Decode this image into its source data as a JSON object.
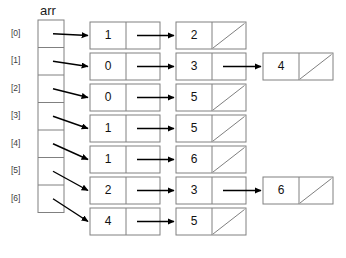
{
  "diagram": {
    "title": "arr",
    "array": {
      "label": "arr",
      "x": 38,
      "y": 20,
      "width": 26,
      "cell_height": 27.5,
      "count": 7,
      "index_labels": [
        "[0]",
        "[1]",
        "[2]",
        "[3]",
        "[4]",
        "[5]",
        "[6]"
      ]
    },
    "node": {
      "width": 70,
      "height": 27,
      "data_width": 36,
      "col_x": [
        90,
        176,
        263
      ]
    },
    "rows": [
      {
        "y": 22,
        "nodes": [
          {
            "value": "1",
            "next": true
          },
          {
            "value": "2",
            "next": false
          }
        ]
      },
      {
        "y": 53,
        "nodes": [
          {
            "value": "0",
            "next": true
          },
          {
            "value": "3",
            "next": true
          },
          {
            "value": "4",
            "next": false
          }
        ]
      },
      {
        "y": 84,
        "nodes": [
          {
            "value": "0",
            "next": true
          },
          {
            "value": "5",
            "next": false
          }
        ]
      },
      {
        "y": 115,
        "nodes": [
          {
            "value": "1",
            "next": true
          },
          {
            "value": "5",
            "next": false
          }
        ]
      },
      {
        "y": 146,
        "nodes": [
          {
            "value": "1",
            "next": true
          },
          {
            "value": "6",
            "next": false
          }
        ]
      },
      {
        "y": 177,
        "nodes": [
          {
            "value": "2",
            "next": true
          },
          {
            "value": "3",
            "next": true
          },
          {
            "value": "6",
            "next": false
          }
        ]
      },
      {
        "y": 208,
        "nodes": [
          {
            "value": "4",
            "next": true
          },
          {
            "value": "5",
            "next": false
          }
        ]
      }
    ],
    "colors": {
      "stroke": "#808080",
      "arrow": "#000000",
      "text": "#111111",
      "index_text": "#3c3c3c",
      "background": "#ffffff"
    }
  }
}
